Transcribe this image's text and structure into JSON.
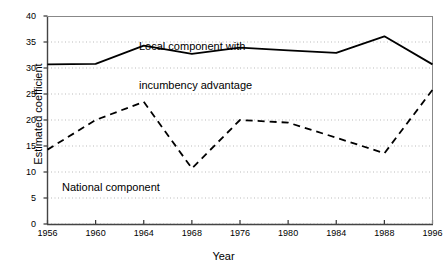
{
  "chart_data": {
    "type": "line",
    "title": "",
    "xlabel": "Year",
    "ylabel": "Estimated coefficient",
    "x": [
      1956,
      1960,
      1964,
      1968,
      1976,
      1980,
      1984,
      1988,
      1996
    ],
    "xticklabels": [
      "1956",
      "1960",
      "1964",
      "1968",
      "1976",
      "1980",
      "1984",
      "1988",
      "1996"
    ],
    "yticklabels": [
      "0",
      "5",
      "10",
      "15",
      "20",
      "25",
      "30",
      "35",
      "40"
    ],
    "yticks": [
      0,
      5,
      10,
      15,
      20,
      25,
      30,
      35,
      40
    ],
    "ylim": [
      0,
      40
    ],
    "grid": "horizontal-dotted",
    "legend": "inline-annotations",
    "series": [
      {
        "name": "Local component with incumbency advantage",
        "style": "solid",
        "color": "#000000",
        "values": [
          30.7,
          30.8,
          34.3,
          32.7,
          33.9,
          33.4,
          32.9,
          36.1,
          30.7
        ]
      },
      {
        "name": "National component",
        "style": "dashed",
        "color": "#000000",
        "values": [
          14.3,
          20.0,
          23.5,
          10.7,
          20.0,
          19.5,
          16.6,
          13.6,
          25.8
        ]
      }
    ],
    "annotations": [
      {
        "id": "local-label",
        "line1": "Local component with",
        "line2": "incumbency advantage"
      },
      {
        "id": "national-label",
        "line1": "National component",
        "line2": ""
      }
    ]
  }
}
